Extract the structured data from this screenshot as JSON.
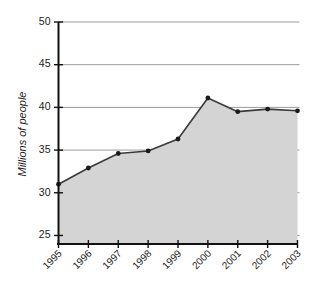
{
  "chart_data": {
    "type": "area",
    "title": "",
    "subtitle": "",
    "xlabel": "",
    "ylabel": "Millions of people",
    "categories": [
      "1995",
      "1996",
      "1997",
      "1998",
      "1999",
      "2000",
      "2001",
      "2002",
      "2003"
    ],
    "values": [
      31.0,
      32.9,
      34.6,
      34.9,
      36.3,
      41.1,
      39.5,
      39.8,
      39.6
    ],
    "series": [
      {
        "name": "Millions of people",
        "values": [
          31.0,
          32.9,
          34.6,
          34.9,
          36.3,
          41.1,
          39.5,
          39.8,
          39.6
        ]
      }
    ],
    "ylim": [
      24,
      50
    ],
    "y_ticks": [
      25,
      30,
      35,
      40,
      45,
      50
    ],
    "y_tick_labels": [
      "25",
      "30",
      "35",
      "40",
      "45",
      "50"
    ],
    "x_ticks": [
      "1995",
      "1996",
      "1997",
      "1998",
      "1999",
      "2000",
      "2001",
      "2002",
      "2003"
    ],
    "grid": true,
    "grid_axis": "y",
    "legend": false,
    "legend_position": "none",
    "markers": true,
    "x_tick_label_rotation": 45,
    "y_axis_title_rotation": 90,
    "colors": {
      "area_fill": "#d4d4d4",
      "line": "#3a3a3a",
      "marker": "#1a1a1a",
      "gridline": "#9a9a9a",
      "axis": "#111111",
      "background": "#ffffff",
      "text": "#1c1c1c"
    }
  }
}
